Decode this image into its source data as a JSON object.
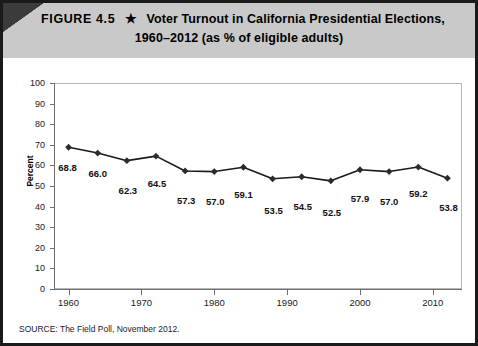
{
  "header": {
    "figure_number": "FIGURE 4.5",
    "star": "★",
    "title_line1": "Voter Turnout in California Presidential Elections,",
    "title_line2": "1960–2012 (as % of eligible adults)",
    "band_color": "#c9c9c9"
  },
  "source": {
    "text": "SOURCE: The Field Poll, November 2012."
  },
  "chart_data": {
    "type": "line",
    "title": "Voter Turnout in California Presidential Elections, 1960–2012 (as % of eligible adults)",
    "xlabel": "",
    "ylabel": "Percent",
    "x": [
      1960,
      1964,
      1968,
      1972,
      1976,
      1980,
      1984,
      1988,
      1992,
      1996,
      2000,
      2004,
      2008,
      2012
    ],
    "values": [
      68.8,
      66.0,
      62.3,
      64.5,
      57.3,
      57.0,
      59.1,
      53.5,
      54.5,
      52.5,
      57.9,
      57.0,
      59.2,
      53.8
    ],
    "point_labels": [
      "68.8",
      "66.0",
      "62.3",
      "64.5",
      "57.3",
      "57.0",
      "59.1",
      "53.5",
      "54.5",
      "52.5",
      "57.9",
      "57.0",
      "59.2",
      "53.8"
    ],
    "xlim": [
      1958,
      2014
    ],
    "ylim": [
      0,
      100
    ],
    "ytick_labels": [
      "100",
      "90",
      "80",
      "70",
      "60",
      "50",
      "40",
      "30",
      "20",
      "10",
      "0"
    ],
    "ytick_values": [
      100,
      90,
      80,
      70,
      60,
      50,
      40,
      30,
      20,
      10,
      0
    ],
    "xtick_labels": [
      "1960",
      "1970",
      "1980",
      "1990",
      "2000",
      "2010"
    ],
    "xtick_values": [
      1960,
      1970,
      1980,
      1990,
      2000,
      2010
    ],
    "grid": false,
    "legend": false,
    "marker": "diamond",
    "line_color": "#1a1a1a",
    "marker_color": "#2b2b2b"
  }
}
